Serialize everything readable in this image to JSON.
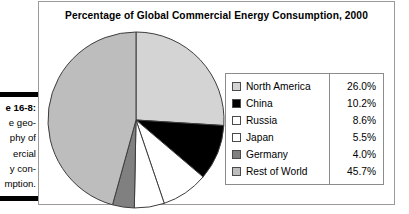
{
  "caption": {
    "lines": [
      {
        "text": "e 16-8:",
        "bold": true
      },
      {
        "text": "e geo-",
        "bold": false
      },
      {
        "text": "phy of",
        "bold": false
      },
      {
        "text": "ercial",
        "bold": false
      },
      {
        "text": "y con-",
        "bold": false
      },
      {
        "text": "mption.",
        "bold": false
      }
    ]
  },
  "figure": {
    "title": "Percentage of Global Commercial Energy Consumption, 2000"
  },
  "chart_data": {
    "type": "pie",
    "title": "Percentage of Global Commercial Energy Consumption, 2000",
    "xlabel": "",
    "ylabel": "",
    "unit": "%",
    "start_angle_deg": 0,
    "direction": "clockwise",
    "legend_position": "right",
    "grid": false,
    "categories": [
      "North America",
      "China",
      "Russia",
      "Japan",
      "Germany",
      "Rest of World"
    ],
    "values": [
      26.0,
      10.2,
      8.6,
      5.5,
      4.0,
      45.7
    ],
    "value_labels": [
      "26.0%",
      "10.2%",
      "8.6%",
      "5.5%",
      "4.0%",
      "45.7%"
    ],
    "colors": [
      "#d4d4d4",
      "#000000",
      "#ffffff",
      "#ffffff",
      "#808080",
      "#bdbdbd"
    ],
    "slice_outline_color": "#3d3d3d",
    "slices": [
      {
        "label": "North America",
        "value": 26.0,
        "value_label": "26.0%",
        "color": "#d4d4d4"
      },
      {
        "label": "China",
        "value": 10.2,
        "value_label": "10.2%",
        "color": "#000000"
      },
      {
        "label": "Russia",
        "value": 8.6,
        "value_label": "8.6%",
        "color": "#ffffff"
      },
      {
        "label": "Japan",
        "value": 5.5,
        "value_label": "5.5%",
        "color": "#ffffff"
      },
      {
        "label": "Germany",
        "value": 4.0,
        "value_label": "4.0%",
        "color": "#808080"
      },
      {
        "label": "Rest of World",
        "value": 45.7,
        "value_label": "45.7%",
        "color": "#bdbdbd"
      }
    ]
  },
  "legend": {
    "rows": [
      {
        "label": "North America",
        "value": "26.0%",
        "swatch": "#d4d4d4"
      },
      {
        "label": "China",
        "value": "10.2%",
        "swatch": "#000000"
      },
      {
        "label": "Russia",
        "value": "8.6%",
        "swatch": "#ffffff"
      },
      {
        "label": "Japan",
        "value": "5.5%",
        "swatch": "#ffffff"
      },
      {
        "label": "Germany",
        "value": "4.0%",
        "swatch": "#808080"
      },
      {
        "label": "Rest of World",
        "value": "45.7%",
        "swatch": "#bdbdbd"
      }
    ]
  }
}
